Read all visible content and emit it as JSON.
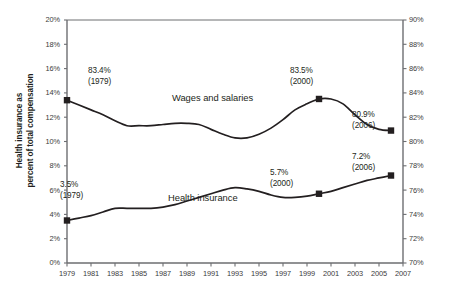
{
  "chart_data": {
    "type": "line",
    "title": "",
    "subtitle": "",
    "xlabel": "",
    "ylabel": "Health insurance as percent of total compensation",
    "ylabel_right": "Wages as percent of total compensation",
    "grid": false,
    "legend": "inline-labels",
    "xlim": [
      1979,
      2007
    ],
    "xticks": [
      "1979",
      "1981",
      "1983",
      "1985",
      "1987",
      "1989",
      "1991",
      "1993",
      "1995",
      "1997",
      "1999",
      "2001",
      "2003",
      "2005",
      "2007"
    ],
    "ylim": [
      0,
      20
    ],
    "yticks": [
      "0%",
      "2%",
      "4%",
      "6%",
      "8%",
      "10%",
      "12%",
      "14%",
      "16%",
      "18%",
      "20%"
    ],
    "ylim_right": [
      70,
      90
    ],
    "yticks_right": [
      "70%",
      "72%",
      "74%",
      "76%",
      "78%",
      "80%",
      "82%",
      "84%",
      "86%",
      "88%",
      "90%"
    ],
    "series": [
      {
        "name": "Wages and salaries",
        "axis": "right",
        "label_text": "Wages and salaries",
        "x": [
          1979,
          1980,
          1981,
          1982,
          1983,
          1984,
          1985,
          1986,
          1987,
          1988,
          1989,
          1990,
          1991,
          1992,
          1993,
          1994,
          1995,
          1996,
          1997,
          1998,
          1999,
          2000,
          2001,
          2002,
          2003,
          2004,
          2005,
          2006
        ],
        "values": [
          83.4,
          83.0,
          82.6,
          82.2,
          81.7,
          81.3,
          81.3,
          81.3,
          81.4,
          81.5,
          81.5,
          81.4,
          81.0,
          80.6,
          80.3,
          80.3,
          80.6,
          81.1,
          81.8,
          82.6,
          83.1,
          83.5,
          83.5,
          83.1,
          82.2,
          81.4,
          81.0,
          80.9
        ],
        "markers": [
          {
            "x": 1979,
            "value": 83.4
          },
          {
            "x": 2000,
            "value": 83.5
          },
          {
            "x": 2006,
            "value": 80.9
          }
        ]
      },
      {
        "name": "Health insurance",
        "axis": "left",
        "label_text": "Health insurance",
        "x": [
          1979,
          1980,
          1981,
          1982,
          1983,
          1984,
          1985,
          1986,
          1987,
          1988,
          1989,
          1990,
          1991,
          1992,
          1993,
          1994,
          1995,
          1996,
          1997,
          1998,
          1999,
          2000,
          2001,
          2002,
          2003,
          2004,
          2005,
          2006
        ],
        "values": [
          3.5,
          3.7,
          3.9,
          4.2,
          4.5,
          4.5,
          4.5,
          4.5,
          4.6,
          4.8,
          5.1,
          5.4,
          5.7,
          6.0,
          6.2,
          6.1,
          5.9,
          5.6,
          5.4,
          5.4,
          5.5,
          5.7,
          5.9,
          6.2,
          6.5,
          6.8,
          7.0,
          7.2
        ],
        "markers": [
          {
            "x": 1979,
            "value": 3.5
          },
          {
            "x": 2000,
            "value": 5.7
          },
          {
            "x": 2006,
            "value": 7.2
          }
        ]
      }
    ],
    "annotations": [
      {
        "id": "wages-1979",
        "value": "83.4%",
        "year": "(1979)"
      },
      {
        "id": "wages-2000",
        "value": "83.5%",
        "year": "(2000)"
      },
      {
        "id": "wages-2006",
        "value": "80.9%",
        "year": "(2006)"
      },
      {
        "id": "health-1979",
        "value": "3.5%",
        "year": "(1979)"
      },
      {
        "id": "health-2000",
        "value": "5.7%",
        "year": "(2000)"
      },
      {
        "id": "health-2006",
        "value": "7.2%",
        "year": "(2006)"
      }
    ],
    "colors": {
      "line": "#231f20",
      "axis": "#6d6e71",
      "tick_text": "#3b3b3b",
      "background": "#ffffff"
    }
  },
  "axes": {
    "left_title_line1": "Health insurance as",
    "left_title_line2": "percent of total compensation",
    "right_title": "Wages as percent of total compensation"
  },
  "labels": {
    "wages_series": "Wages and salaries",
    "health_series": "Health insurance"
  },
  "annotations": {
    "wages_1979_value": "83.4%",
    "wages_1979_year": "(1979)",
    "wages_2000_value": "83.5%",
    "wages_2000_year": "(2000)",
    "wages_2006_value": "80.9%",
    "wages_2006_year": "(2006)",
    "health_1979_value": "3.5%",
    "health_1979_year": "(1979)",
    "health_2000_value": "5.7%",
    "health_2000_year": "(2000)",
    "health_2006_value": "7.2%",
    "health_2006_year": "(2006)"
  }
}
